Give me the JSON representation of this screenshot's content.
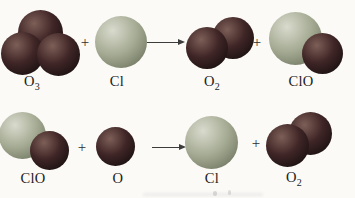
{
  "colors": {
    "background": "#fbfaf7",
    "oxygen_highlight": "#7d5f57",
    "oxygen_mid": "#3f2526",
    "oxygen_edge": "#120c0c",
    "chlorine_highlight": "#d9dbcd",
    "chlorine_mid": "#a0a68e",
    "chlorine_edge": "#5e6550",
    "text": "#1c1c1c"
  },
  "symbols": {
    "plus": "+"
  },
  "reactions": [
    {
      "equation": "O3 + Cl -> O2 + ClO",
      "reactants": [
        "O3",
        "Cl"
      ],
      "products": [
        "O2",
        "ClO"
      ]
    },
    {
      "equation": "ClO + O -> Cl + O2",
      "reactants": [
        "ClO",
        "O"
      ],
      "products": [
        "Cl",
        "O2"
      ]
    }
  ],
  "molecules": [
    {
      "name": "ozone",
      "formula": "O3",
      "atoms": [
        "O",
        "O",
        "O"
      ]
    },
    {
      "name": "chlorine-atom",
      "formula": "Cl",
      "atoms": [
        "Cl"
      ]
    },
    {
      "name": "oxygen-molecule",
      "formula": "O2",
      "atoms": [
        "O",
        "O"
      ]
    },
    {
      "name": "chlorine-monoxide",
      "formula": "ClO",
      "atoms": [
        "Cl",
        "O"
      ]
    },
    {
      "name": "oxygen-atom",
      "formula": "O",
      "atoms": [
        "O"
      ]
    }
  ],
  "labels": [
    {
      "main": "O",
      "sub": "3"
    },
    {
      "main": "Cl",
      "sub": ""
    },
    {
      "main": "O",
      "sub": "2"
    },
    {
      "main": "ClO",
      "sub": ""
    },
    {
      "main": "ClO",
      "sub": ""
    },
    {
      "main": "O",
      "sub": ""
    },
    {
      "main": "Cl",
      "sub": ""
    },
    {
      "main": "O",
      "sub": "2"
    }
  ]
}
